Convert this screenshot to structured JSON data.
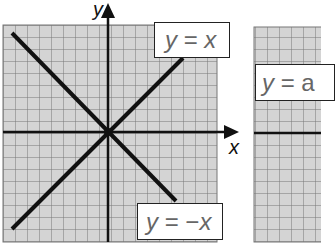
{
  "panels": [
    {
      "id": "left",
      "axes": {
        "x_label": "x",
        "y_label": "y"
      },
      "lines": [
        {
          "equation": "y = x",
          "label_parts": [
            "y",
            " = ",
            "x"
          ]
        },
        {
          "equation": "y = −x",
          "label_parts": [
            "y",
            " = −",
            "x"
          ]
        }
      ]
    },
    {
      "id": "right",
      "lines": [
        {
          "equation": "y = a",
          "label_parts": [
            "y",
            " = ",
            "a"
          ]
        }
      ]
    }
  ],
  "colors": {
    "grid_bg": "#d4d4d4",
    "grid_line": "#777777",
    "line": "#111111",
    "label_text": "#666666"
  }
}
